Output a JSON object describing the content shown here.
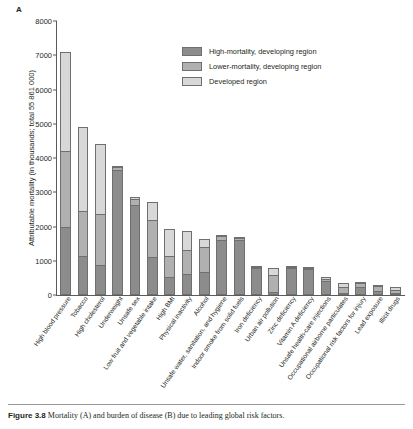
{
  "figure": {
    "panel_label": "A",
    "caption_bold": "Figure 3.8",
    "caption_text": "Mortality (A) and burden of disease (B) due to leading global risk factors."
  },
  "colors": {
    "high_mortality_developing": "#8c8c8c",
    "lower_mortality_developing": "#b0b0b0",
    "developed": "#d8d8d8",
    "axis": "#5b5b5b",
    "text": "#231f20"
  },
  "legend": {
    "position": "top-center-right",
    "entries": [
      {
        "label": "High-mortality, developing region",
        "color": "#8c8c8c"
      },
      {
        "label": "Lower-mortality, developing region",
        "color": "#b0b0b0"
      },
      {
        "label": "Developed region",
        "color": "#d8d8d8"
      }
    ]
  },
  "chart_data": {
    "type": "bar",
    "stacked": true,
    "title": "",
    "xlabel": "",
    "ylabel": "Attributable mortality (in thousands; total 55 861 000)",
    "ylim": [
      0,
      8000
    ],
    "yticks": [
      0,
      1000,
      2000,
      3000,
      4000,
      5000,
      6000,
      7000,
      8000
    ],
    "ytick_labels": [
      "0",
      "1000",
      "2000",
      "3000",
      "4000",
      "5000",
      "6000",
      "7000",
      "8000"
    ],
    "grid": false,
    "categories": [
      "High blood pressure",
      "Tobacco",
      "High cholesterol",
      "Underweight",
      "Unsafe sex",
      "Low fruit and vegetable intake",
      "High BMI",
      "Physical inactivity",
      "Alcohol",
      "Unsafe water, sanitation, and hygiene",
      "Indoor smoke from solid fuels",
      "Iron deficiency",
      "Urban air pollution",
      "Zinc deficiency",
      "Vitamin A deficiency",
      "Unsafe health-care injections",
      "Occupational airborne particulates",
      "Occupational risk factors for injury",
      "Lead exposure",
      "Illicit drugs"
    ],
    "series": [
      {
        "name": "High-mortality, developing region",
        "color": "#8c8c8c",
        "values": [
          2000,
          1150,
          870,
          3640,
          2620,
          1110,
          530,
          610,
          680,
          1620,
          1600,
          790,
          100,
          790,
          760,
          420,
          60,
          220,
          120,
          60
        ]
      },
      {
        "name": "Lower-mortality, developing region",
        "color": "#b0b0b0",
        "values": [
          2200,
          1300,
          1500,
          90,
          180,
          1080,
          610,
          700,
          720,
          100,
          60,
          20,
          470,
          20,
          20,
          60,
          160,
          130,
          130,
          100
        ]
      },
      {
        "name": "Developed region",
        "color": "#d8d8d8",
        "values": [
          2900,
          2450,
          2030,
          20,
          60,
          530,
          790,
          570,
          250,
          10,
          10,
          10,
          230,
          10,
          10,
          30,
          130,
          30,
          40,
          60
        ]
      }
    ],
    "totals": [
      7100,
      4900,
      4400,
      3750,
      2860,
      2720,
      1930,
      1880,
      1650,
      1730,
      1670,
      820,
      800,
      820,
      790,
      510,
      350,
      380,
      290,
      220
    ]
  }
}
